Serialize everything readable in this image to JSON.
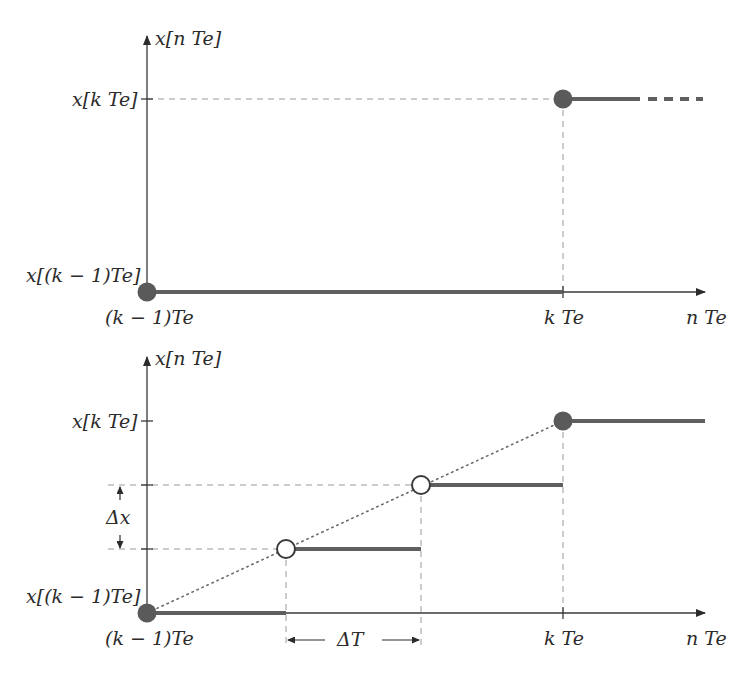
{
  "colors": {
    "axis": "#3a3a3a",
    "signal": "#5f5f5f",
    "dot_fill": "#5a5a5a",
    "guide": "#9a9a9a",
    "text": "#2b2b2b",
    "background": "#ffffff"
  },
  "top_plot": {
    "y_axis_label": "x[n Te]",
    "y_tick_high": "x[k Te]",
    "y_tick_low": "x[(k − 1)Te]",
    "x_tick_start": "(k − 1)Te",
    "x_tick_k": "k Te",
    "x_axis_label": "n Te",
    "description": "Zero-order hold: value x[(k−1)Te] held until kTe, then jumps to x[kTe] (dashed continuation)"
  },
  "bottom_plot": {
    "y_axis_label": "x[n Te]",
    "y_tick_high": "x[k Te]",
    "y_tick_low": "x[(k − 1)Te]",
    "x_tick_start": "(k − 1)Te",
    "x_tick_k": "k Te",
    "x_axis_label": "n Te",
    "delta_x_label": "Δx",
    "delta_t_label": "ΔT",
    "description": "Interpolated steps between (k−1)Te and kTe with step size ΔT in time and Δx in amplitude, following a dotted linear ramp"
  }
}
